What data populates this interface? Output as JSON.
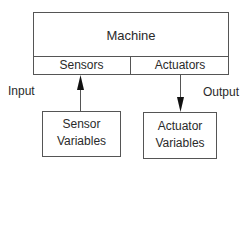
{
  "diagram": {
    "machine": {
      "label": "Machine"
    },
    "sensors": {
      "label": "Sensors"
    },
    "actuators": {
      "label": "Actuators"
    },
    "input_label": "Input",
    "output_label": "Output",
    "sensor_variables": {
      "line1": "Sensor",
      "line2": "Variables"
    },
    "actuator_variables": {
      "line1": "Actuator",
      "line2": "Variables"
    },
    "edges": [
      {
        "from": "sensor_variables",
        "to": "sensors",
        "label": "Input"
      },
      {
        "from": "actuators",
        "to": "actuator_variables",
        "label": "Output"
      }
    ]
  }
}
